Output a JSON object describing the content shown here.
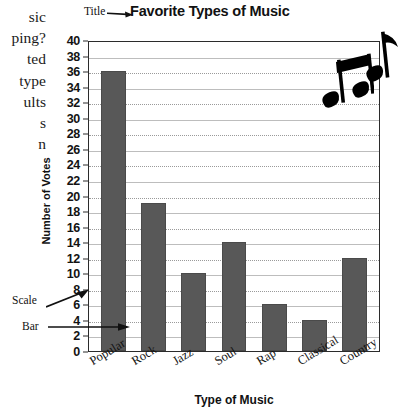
{
  "margin_text": {
    "lines": [
      "sic",
      "ping?",
      "ted",
      "type",
      "ults",
      "s",
      "n"
    ]
  },
  "callouts": {
    "title": "Title",
    "scale": "Scale",
    "bar": "Bar"
  },
  "icons": {
    "title_arrow": "arrow-right-icon",
    "scale_arrow": "arrow-up-right-icon",
    "bar_arrow": "arrow-right-icon",
    "note_pair": "beamed-eighth-notes-icon",
    "note_single": "eighth-note-icon"
  },
  "colors": {
    "bar_fill": "#585858",
    "axis": "#2b2b2b",
    "gridline_dotted": "#9a9a9a",
    "gridline_solid": "#bdbdbd"
  },
  "chart_data": {
    "type": "bar",
    "title": "Favorite Types of Music",
    "xlabel": "Type of Music",
    "ylabel": "Number of Votes",
    "categories": [
      "Popular",
      "Rock",
      "Jazz",
      "Soul",
      "Rap",
      "Classical",
      "Country"
    ],
    "values": [
      36,
      19,
      10,
      14,
      6,
      4,
      12
    ],
    "ylim": [
      0,
      40
    ],
    "ytick_step": 2,
    "yticks": [
      0,
      2,
      4,
      6,
      8,
      10,
      12,
      14,
      16,
      18,
      20,
      22,
      24,
      26,
      28,
      30,
      32,
      34,
      36,
      38,
      40
    ],
    "grid": true,
    "legend": "none"
  }
}
